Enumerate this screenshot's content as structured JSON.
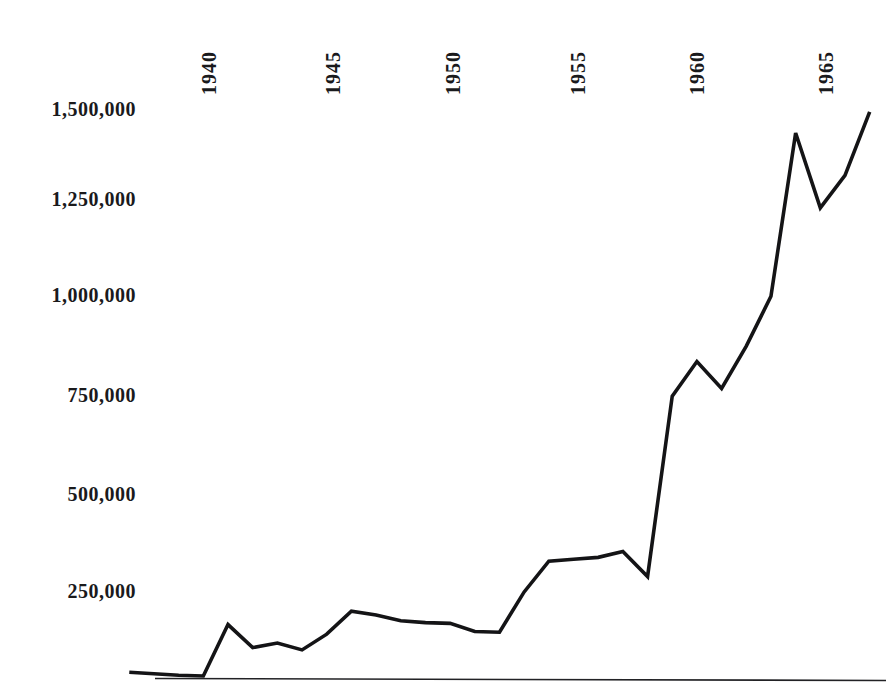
{
  "chart_data": {
    "type": "line",
    "title": "",
    "subtitle": "",
    "xlabel": "",
    "ylabel": "",
    "grid": false,
    "legend": "none",
    "xlim": [
      1936,
      1967
    ],
    "ylim": [
      0,
      1560000
    ],
    "x_tick_labels": [
      "1940",
      "1945",
      "1950",
      "1955",
      "1960",
      "1965"
    ],
    "x_tick_values": [
      1940,
      1945,
      1950,
      1955,
      1960,
      1965
    ],
    "y_tick_labels": [
      "1,500,000",
      "1,250,000",
      "1,000,000",
      "750,000",
      "500,000",
      "250,000"
    ],
    "y_tick_values": [
      1500000,
      1250000,
      1000000,
      750000,
      500000,
      250000
    ],
    "series": [
      {
        "name": "series-1",
        "color": "#141416",
        "x": [
          1936,
          1937,
          1938,
          1939,
          1940,
          1941,
          1942,
          1943,
          1944,
          1945,
          1946,
          1947,
          1948,
          1949,
          1950,
          1951,
          1952,
          1953,
          1954,
          1955,
          1956,
          1957,
          1958,
          1959,
          1960,
          1961,
          1962,
          1963,
          1964,
          1965,
          1966
        ],
        "values": [
          36000,
          32000,
          28000,
          26000,
          160000,
          100000,
          112000,
          94000,
          135000,
          195000,
          185000,
          170000,
          165000,
          163000,
          142000,
          140000,
          245000,
          325000,
          330000,
          335000,
          350000,
          285000,
          755000,
          845000,
          775000,
          885000,
          1015000,
          1440000,
          1245000,
          1330000,
          1495000
        ]
      }
    ],
    "axis": {
      "baseline_label": "x-axis-rule"
    }
  }
}
